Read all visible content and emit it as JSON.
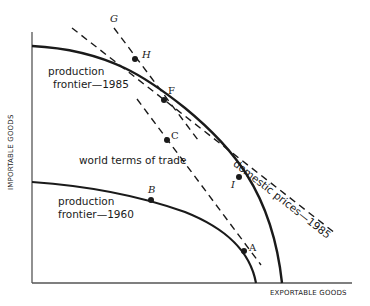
{
  "axes": {
    "x_label": "EXPORTABLE GOODS",
    "y_label": "IMPORTABLE GOODS"
  },
  "curves": {
    "frontier_1985": {
      "label_line1": "production",
      "label_line2": "frontier—1985"
    },
    "frontier_1960": {
      "label_line1": "production",
      "label_line2": "frontier—1960"
    }
  },
  "lines": {
    "domestic_prices": {
      "label": "domestic prices—1985",
      "style": "dashed"
    },
    "world_terms": {
      "label": "world terms of trade",
      "style": "dashed"
    },
    "tangent_1985": {
      "style": "dashed"
    }
  },
  "points": {
    "G": "G",
    "H": "H",
    "F": "F",
    "C": "C",
    "I": "I",
    "B": "B",
    "A": "A"
  },
  "colors": {
    "ink": "#1a1a1a",
    "axis": "#555555",
    "background": "#ffffff"
  }
}
